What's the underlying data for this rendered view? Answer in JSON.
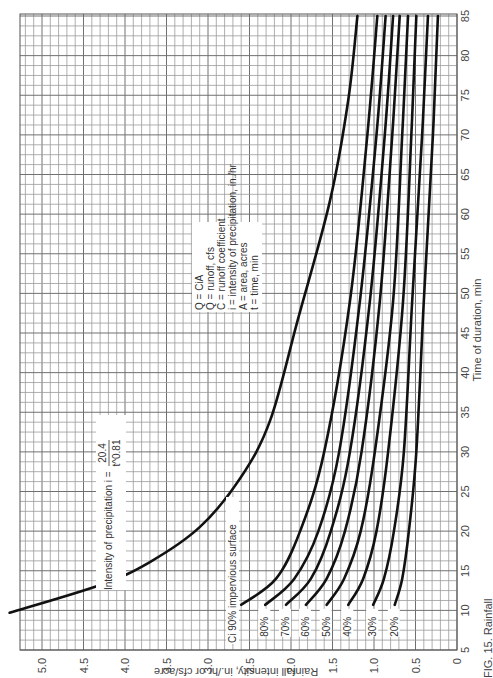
{
  "chart_data": {
    "type": "line",
    "orientation": "rotated-90-ccw",
    "title": "",
    "caption": "FIG. 15. Rainfall",
    "xlabel": "Time of duration, min",
    "ylabel": "Rainfall intensity, in./hr or cfs/acre",
    "xlim": [
      5,
      85
    ],
    "ylim": [
      0,
      5.4
    ],
    "x_ticks": [
      5,
      10,
      15,
      20,
      25,
      30,
      35,
      40,
      45,
      50,
      55,
      60,
      65,
      70,
      75,
      80,
      85
    ],
    "y_ticks": [
      "0",
      "0.5",
      "1.0",
      "1.5",
      "2.0",
      "2.5",
      "3.0",
      "3.5",
      "4.0",
      "4.5",
      "5.0"
    ],
    "grid": true,
    "grid_step": {
      "x": 1.25,
      "y": 0.1
    },
    "annotations": {
      "formula_label": "Intensity of precipitation i =",
      "formula_num": "20.4",
      "formula_den": "t^0.81",
      "legend_lines": [
        "Q = CiA",
        "Q = runoff, cfs",
        "C = runoff coefficient",
        "i = intensity of precipitation, in./hr",
        "A = area, acres",
        "t = time, min"
      ],
      "ci_label": "Ci 90% impervious surface"
    },
    "series": [
      {
        "name": "Intensity of precipitation i",
        "label": "",
        "x": [
          9.7,
          13.2,
          16.1,
          20.5,
          26.7,
          34.0,
          46.6,
          61.7,
          74.4,
          85.0
        ],
        "values": [
          5.39,
          4.3,
          3.7,
          3.1,
          2.61,
          2.25,
          1.92,
          1.53,
          1.31,
          1.2
        ]
      },
      {
        "name": "Ci 90%",
        "label": "",
        "x": [
          10.7,
          14,
          20,
          30,
          49,
          70,
          85
        ],
        "values": [
          2.6,
          2.18,
          1.89,
          1.6,
          1.29,
          1.08,
          0.96
        ]
      },
      {
        "name": "Ci 80%",
        "label": "80%",
        "x": [
          10.7,
          14,
          20,
          30,
          49,
          70,
          85
        ],
        "values": [
          2.31,
          1.96,
          1.67,
          1.42,
          1.17,
          0.97,
          0.86
        ]
      },
      {
        "name": "Ci 70%",
        "label": "70%",
        "x": [
          10.7,
          14,
          20,
          30,
          49,
          70,
          85
        ],
        "values": [
          2.06,
          1.76,
          1.52,
          1.29,
          1.05,
          0.87,
          0.77
        ]
      },
      {
        "name": "Ci 60%",
        "label": "60%",
        "x": [
          10.7,
          14,
          20,
          30,
          49,
          70,
          85
        ],
        "values": [
          1.82,
          1.57,
          1.35,
          1.15,
          0.93,
          0.78,
          0.69
        ]
      },
      {
        "name": "Ci 50%",
        "label": "50%",
        "x": [
          10.7,
          14,
          20,
          30,
          49,
          70,
          85
        ],
        "values": [
          1.57,
          1.36,
          1.16,
          0.99,
          0.77,
          0.66,
          0.59
        ]
      },
      {
        "name": "Ci 40%",
        "label": "40%",
        "x": [
          10.7,
          14,
          20,
          30,
          49,
          70,
          85
        ],
        "values": [
          1.31,
          1.13,
          0.97,
          0.83,
          0.65,
          0.55,
          0.49
        ]
      },
      {
        "name": "Ci 30%",
        "label": "30%",
        "x": [
          10.7,
          14,
          20,
          30,
          49,
          70,
          85
        ],
        "values": [
          1.01,
          0.88,
          0.76,
          0.64,
          0.54,
          0.42,
          0.35
        ]
      },
      {
        "name": "Ci 20%",
        "label": "20%",
        "x": [
          10.7,
          14,
          20,
          30,
          49,
          70,
          85
        ],
        "values": [
          0.75,
          0.66,
          0.58,
          0.49,
          0.4,
          0.29,
          0.23
        ]
      }
    ]
  }
}
